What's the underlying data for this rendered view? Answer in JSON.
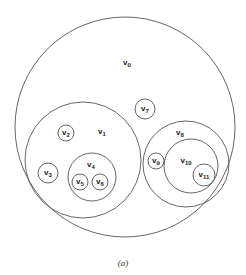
{
  "caption": "(a)",
  "colors": {
    "stroke": "#555555",
    "text": "#222222",
    "background": "#ffffff"
  },
  "nodes": [
    {
      "id": "v0",
      "label": "v",
      "sub": "0",
      "cx": 125,
      "cy": 127,
      "r": 110,
      "lx": 127,
      "ly": 63,
      "parent": null
    },
    {
      "id": "v1",
      "label": "v",
      "sub": "1",
      "cx": 83,
      "cy": 160,
      "r": 58,
      "lx": 102,
      "ly": 132,
      "parent": "v0"
    },
    {
      "id": "v2",
      "label": "v",
      "sub": "2",
      "cx": 66,
      "cy": 133,
      "r": 8,
      "lx": 66,
      "ly": 133,
      "parent": "v1"
    },
    {
      "id": "v3",
      "label": "v",
      "sub": "3",
      "cx": 48,
      "cy": 173,
      "r": 10,
      "lx": 48,
      "ly": 173,
      "parent": "v1"
    },
    {
      "id": "v4",
      "label": "v",
      "sub": "4",
      "cx": 92,
      "cy": 177,
      "r": 24,
      "lx": 91,
      "ly": 165,
      "parent": "v1"
    },
    {
      "id": "v5",
      "label": "v",
      "sub": "5",
      "cx": 80,
      "cy": 182,
      "r": 8,
      "lx": 80,
      "ly": 182,
      "parent": "v4"
    },
    {
      "id": "v6",
      "label": "v",
      "sub": "6",
      "cx": 100,
      "cy": 182,
      "r": 8,
      "lx": 100,
      "ly": 182,
      "parent": "v4"
    },
    {
      "id": "v7",
      "label": "v",
      "sub": "7",
      "cx": 145,
      "cy": 109,
      "r": 10,
      "lx": 145,
      "ly": 109,
      "parent": "v0"
    },
    {
      "id": "v8",
      "label": "v",
      "sub": "8",
      "cx": 186,
      "cy": 164,
      "r": 43,
      "lx": 180,
      "ly": 133,
      "parent": "v0"
    },
    {
      "id": "v9",
      "label": "v",
      "sub": "9",
      "cx": 156,
      "cy": 161,
      "r": 8,
      "lx": 156,
      "ly": 161,
      "parent": "v8"
    },
    {
      "id": "v10",
      "label": "v",
      "sub": "10",
      "cx": 191,
      "cy": 166,
      "r": 27,
      "lx": 186,
      "ly": 161,
      "parent": "v8"
    },
    {
      "id": "v11",
      "label": "v",
      "sub": "11",
      "cx": 204,
      "cy": 175,
      "r": 11,
      "lx": 204,
      "ly": 175,
      "parent": "v10"
    }
  ]
}
